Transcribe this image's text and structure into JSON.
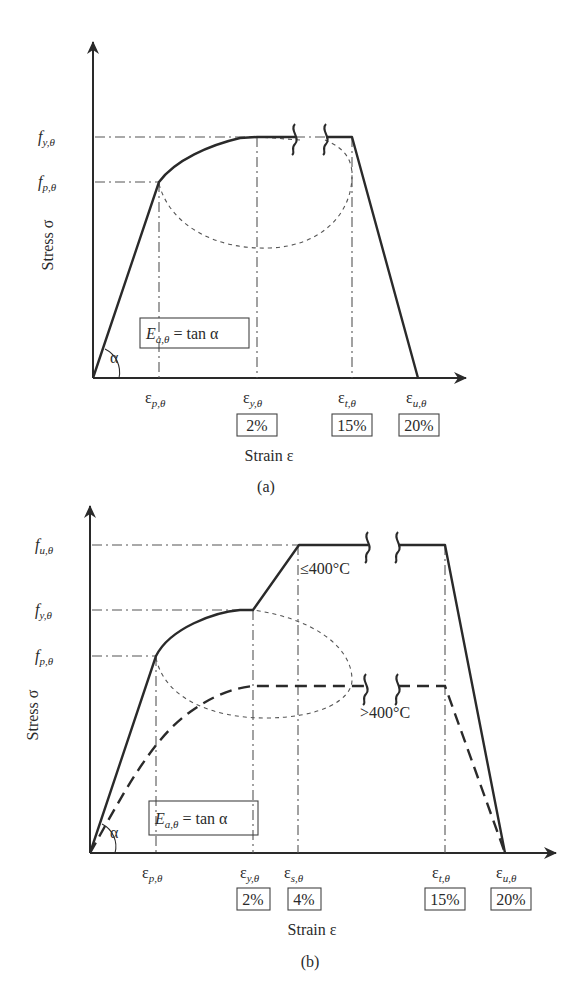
{
  "panels": [
    {
      "id": "a",
      "caption": "(a)",
      "y_axis_label": "Stress σ",
      "x_axis_label": "Strain ε",
      "y_ticks": {
        "fy": {
          "main": "f",
          "sub": "y,θ"
        },
        "fp": {
          "main": "f",
          "sub": "p,θ"
        }
      },
      "x_ticks": {
        "ep": {
          "main": "ε",
          "sub": "p,θ"
        },
        "ey": {
          "main": "ε",
          "sub": "y,θ",
          "value": "2%"
        },
        "et": {
          "main": "ε",
          "sub": "t,θ",
          "value": "15%"
        },
        "eu": {
          "main": "ε",
          "sub": "u,θ",
          "value": "20%"
        }
      },
      "modulus_box": {
        "main": "E",
        "sub": "a,θ",
        "rest": " = tan α"
      },
      "angle_label": "α"
    },
    {
      "id": "b",
      "caption": "(b)",
      "y_axis_label": "Stress σ",
      "x_axis_label": "Strain ε",
      "y_ticks": {
        "fu": {
          "main": "f",
          "sub": "u,θ"
        },
        "fy": {
          "main": "f",
          "sub": "y,θ"
        },
        "fp": {
          "main": "f",
          "sub": "p,θ"
        }
      },
      "x_ticks": {
        "ep": {
          "main": "ε",
          "sub": "p,θ"
        },
        "ey": {
          "main": "ε",
          "sub": "y,θ",
          "value": "2%"
        },
        "es": {
          "main": "ε",
          "sub": "s,θ",
          "value": "4%"
        },
        "et": {
          "main": "ε",
          "sub": "t,θ",
          "value": "15%"
        },
        "eu": {
          "main": "ε",
          "sub": "u,θ",
          "value": "20%"
        }
      },
      "modulus_box": {
        "main": "E",
        "sub": "a,θ",
        "rest": " = tan α"
      },
      "angle_label": "α",
      "curve_labels": {
        "low_temp": "≤400°C",
        "high_temp": ">400°C"
      }
    }
  ]
}
